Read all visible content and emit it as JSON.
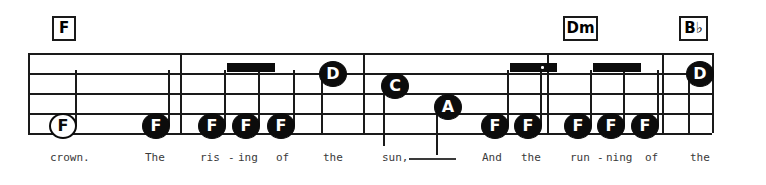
{
  "score": {
    "staff": {
      "left": 28,
      "right": 712,
      "line_ys": [
        53,
        73,
        93,
        113,
        133
      ],
      "color": "#1a1a1a"
    },
    "barlines": [
      {
        "name": "barline-1",
        "x": 180
      },
      {
        "name": "barline-2",
        "x": 363
      },
      {
        "name": "barline-3",
        "x": 547
      },
      {
        "name": "barline-4",
        "x": 662
      }
    ],
    "chords": [
      {
        "name": "chord-f-1",
        "label": "F",
        "x": 52,
        "y": 16,
        "w": 24,
        "h": 25
      },
      {
        "name": "chord-dm",
        "label": "Dm",
        "x": 563,
        "y": 16,
        "w": 35,
        "h": 25
      },
      {
        "name": "chord-bb",
        "label": "B♭",
        "x": 679,
        "y": 16,
        "w": 29,
        "h": 25
      }
    ],
    "notes": [
      {
        "name": "note-1",
        "pitch": "F",
        "x": 63,
        "y": 126,
        "style": "open",
        "stem": "up",
        "stem_h": 56,
        "measure": 1
      },
      {
        "name": "note-2",
        "pitch": "F",
        "x": 156,
        "y": 126,
        "style": "filled",
        "stem": "up",
        "stem_h": 56,
        "measure": 1
      },
      {
        "name": "note-3",
        "pitch": "F",
        "x": 212,
        "y": 126,
        "style": "filled",
        "stem": "up",
        "stem_h": 56,
        "measure": 2
      },
      {
        "name": "note-4",
        "pitch": "F",
        "x": 246,
        "y": 126,
        "style": "filled",
        "stem": "up",
        "stem_h": 56,
        "measure": 2
      },
      {
        "name": "note-5",
        "pitch": "F",
        "x": 281,
        "y": 126,
        "style": "filled",
        "stem": "up",
        "stem_h": 56,
        "measure": 2
      },
      {
        "name": "note-6",
        "pitch": "D",
        "x": 333,
        "y": 74,
        "style": "filled",
        "stem": "down",
        "stem_h": 60,
        "measure": 2
      },
      {
        "name": "note-7",
        "pitch": "C",
        "x": 395,
        "y": 86,
        "style": "filled",
        "stem": "down",
        "stem_h": 60,
        "measure": 3
      },
      {
        "name": "note-8",
        "pitch": "A",
        "x": 448,
        "y": 107,
        "style": "filled",
        "stem": "down",
        "stem_h": 48,
        "measure": 3
      },
      {
        "name": "note-9",
        "pitch": "F",
        "x": 495,
        "y": 126,
        "style": "filled",
        "stem": "up",
        "stem_h": 56,
        "measure": 3
      },
      {
        "name": "note-10",
        "pitch": "F",
        "x": 528,
        "y": 126,
        "style": "filled",
        "stem": "up",
        "stem_h": 56,
        "measure": 3
      },
      {
        "name": "note-11",
        "pitch": "F",
        "x": 578,
        "y": 126,
        "style": "filled",
        "stem": "up",
        "stem_h": 56,
        "measure": 4
      },
      {
        "name": "note-12",
        "pitch": "F",
        "x": 611,
        "y": 126,
        "style": "filled",
        "stem": "up",
        "stem_h": 56,
        "measure": 4
      },
      {
        "name": "note-13",
        "pitch": "F",
        "x": 645,
        "y": 126,
        "style": "filled",
        "stem": "up",
        "stem_h": 56,
        "measure": 4
      },
      {
        "name": "note-14",
        "pitch": "D",
        "x": 700,
        "y": 74,
        "style": "filled",
        "stem": "down",
        "stem_h": 60,
        "measure": 5
      }
    ],
    "beams": [
      {
        "name": "beam-1",
        "x": 227,
        "y": 63,
        "w": 48,
        "h": 9,
        "dotted": false
      },
      {
        "name": "beam-2",
        "x": 510,
        "y": 63,
        "w": 47,
        "h": 9,
        "dotted": true,
        "dot_x": 541,
        "dot_y": 66
      },
      {
        "name": "beam-3",
        "x": 593,
        "y": 63,
        "w": 48,
        "h": 9,
        "dotted": false
      }
    ],
    "lyrics": [
      {
        "name": "lyric-crown",
        "text": "crown.",
        "x": 50,
        "y": 152
      },
      {
        "name": "lyric-the-1",
        "text": "The",
        "x": 145,
        "y": 152
      },
      {
        "name": "lyric-ris",
        "text": "ris",
        "x": 200,
        "y": 152
      },
      {
        "name": "lyric-hyph-1",
        "text": "-",
        "x": 228,
        "y": 152
      },
      {
        "name": "lyric-ing-1",
        "text": "ing",
        "x": 238,
        "y": 152
      },
      {
        "name": "lyric-of-1",
        "text": "of",
        "x": 276,
        "y": 152
      },
      {
        "name": "lyric-the-2",
        "text": "the",
        "x": 323,
        "y": 152
      },
      {
        "name": "lyric-sun",
        "text": "sun,",
        "x": 382,
        "y": 152
      },
      {
        "name": "lyric-and",
        "text": "And",
        "x": 482,
        "y": 152
      },
      {
        "name": "lyric-the-3",
        "text": "the",
        "x": 521,
        "y": 152
      },
      {
        "name": "lyric-run",
        "text": "run",
        "x": 570,
        "y": 152
      },
      {
        "name": "lyric-hyph-2",
        "text": "-",
        "x": 597,
        "y": 152
      },
      {
        "name": "lyric-ning",
        "text": "ning",
        "x": 606,
        "y": 152
      },
      {
        "name": "lyric-of-2",
        "text": "of",
        "x": 645,
        "y": 152
      },
      {
        "name": "lyric-the-4",
        "text": "the",
        "x": 690,
        "y": 152
      }
    ],
    "melismas": [
      {
        "name": "melisma-sun",
        "x": 409,
        "y": 158,
        "w": 47
      }
    ]
  }
}
